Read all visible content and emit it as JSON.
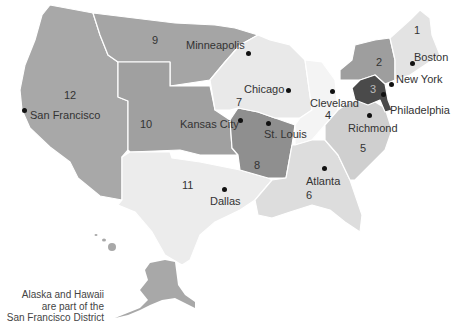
{
  "districts": [
    {
      "number": "1",
      "city": "Boston",
      "color": "#e3e3e3"
    },
    {
      "number": "2",
      "city": "New York",
      "color": "#9e9e9e"
    },
    {
      "number": "3",
      "city": "Philadelphia",
      "color": "#4a4a4a"
    },
    {
      "number": "4",
      "city": "Cleveland",
      "color": "#f4f4f4"
    },
    {
      "number": "5",
      "city": "Richmond",
      "color": "#cfcfcf"
    },
    {
      "number": "6",
      "city": "Atlanta",
      "color": "#dddddd"
    },
    {
      "number": "7",
      "city": "Chicago",
      "color": "#e9e9e9"
    },
    {
      "number": "8",
      "city": "St. Louis",
      "color": "#8f8f8f"
    },
    {
      "number": "9",
      "city": "Minneapolis",
      "color": "#a5a5a5"
    },
    {
      "number": "10",
      "city": "Kansas City",
      "color": "#a0a0a0"
    },
    {
      "number": "11",
      "city": "Dallas",
      "color": "#ececec"
    },
    {
      "number": "12",
      "city": "San Francisco",
      "color": "#a8a8a8"
    }
  ],
  "note": {
    "line1": "Alaska and Hawaii",
    "line2": "are part of the",
    "line3": "San Francisco District"
  }
}
